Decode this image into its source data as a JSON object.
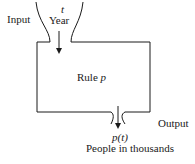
{
  "diagram": {
    "type": "function-machine",
    "input": {
      "label": "Input",
      "variable": "t",
      "unit": "Year"
    },
    "machine": {
      "prefix": "Rule ",
      "name": "p"
    },
    "output": {
      "label": "Output",
      "expression": "p(t)",
      "unit": "People in thousands"
    },
    "colors": {
      "stroke": "#1a1a1a",
      "background": "#ffffff"
    }
  }
}
